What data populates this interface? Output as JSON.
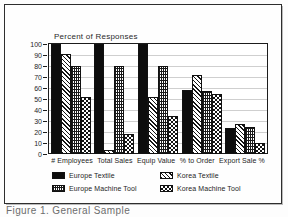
{
  "page": {
    "caption": "Figure 1.  General Sample",
    "background_color": "#fdfdfd",
    "border_color": "#2e2e2e"
  },
  "chart_data": {
    "type": "bar",
    "title": "Percent of Responses",
    "xlabel": "",
    "ylabel": "",
    "ylim": [
      0,
      100
    ],
    "ytick_step": 10,
    "grid": true,
    "legend_position": "bottom",
    "categories": [
      "# Employees",
      "Total Sales",
      "Equip Value",
      "% to Order",
      "Export Sale %"
    ],
    "yticks": [
      "100",
      "90",
      "80",
      "70",
      "60",
      "50",
      "40",
      "30",
      "20",
      "10",
      "0"
    ],
    "series": [
      {
        "name": "Europe Textile",
        "pattern": "solid-black",
        "color": "#0d0d0d",
        "values": [
          100,
          100,
          100,
          58,
          24
        ]
      },
      {
        "name": "Korea Textile",
        "pattern": "diagonal-hatch",
        "color": "#151515",
        "values": [
          91,
          4,
          52,
          72,
          27
        ]
      },
      {
        "name": "Europe Machine Tool",
        "pattern": "fine-grid",
        "color": "#1a1a1a",
        "values": [
          80,
          80,
          80,
          57,
          25
        ]
      },
      {
        "name": "Korea Machine Tool",
        "pattern": "checkerboard",
        "color": "#141414",
        "values": [
          52,
          18,
          35,
          55,
          10
        ]
      }
    ]
  }
}
